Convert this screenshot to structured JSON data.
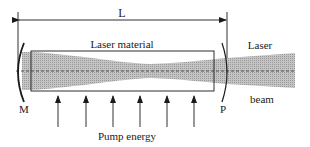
{
  "diagram": {
    "type": "laser-resonator-schematic",
    "dimension_label": "L",
    "material_label": "Laser material",
    "output_label_line1": "Laser",
    "output_label_line2": "beam",
    "mirror_left_label": "M",
    "mirror_right_label": "P",
    "pump_label": "Pump energy",
    "pump_arrow_count": 6,
    "colors": {
      "line": "#1a1a1a",
      "beam_fill": "#b8b8b8",
      "background": "#ffffff"
    }
  }
}
